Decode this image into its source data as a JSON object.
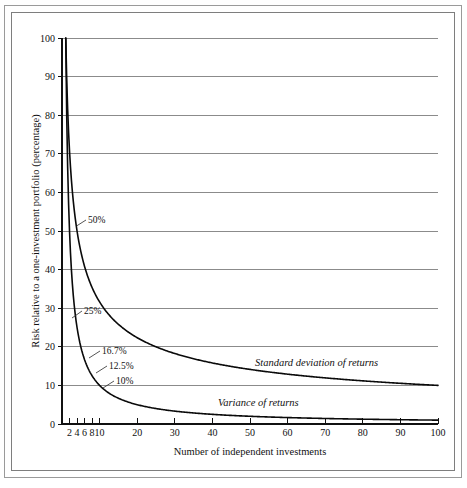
{
  "chart_data": {
    "type": "line",
    "title": "",
    "xlabel": "Number of independent investments",
    "ylabel": "Risk relative to a one-investment portfolio (percentage)",
    "xlim": [
      0,
      100
    ],
    "ylim": [
      0,
      100
    ],
    "grid": true,
    "legend_position": "inline-annotation",
    "x_ticks": [
      2,
      4,
      6,
      8,
      10,
      20,
      30,
      40,
      50,
      60,
      70,
      80,
      90,
      100
    ],
    "x_tick_labels": [
      "2",
      "4",
      "6",
      "8",
      "10",
      "20",
      "30",
      "40",
      "50",
      "60",
      "70",
      "80",
      "90",
      "100"
    ],
    "y_ticks": [
      0,
      10,
      20,
      30,
      40,
      50,
      60,
      70,
      80,
      90,
      100
    ],
    "y_tick_labels": [
      "0",
      "10",
      "20",
      "30",
      "40",
      "50",
      "60",
      "70",
      "80",
      "90",
      "100"
    ],
    "series": [
      {
        "name": "Standard deviation of returns",
        "formula": "100 / sqrt(n)",
        "x": [
          1,
          2,
          3,
          4,
          5,
          6,
          7,
          8,
          9,
          10,
          12,
          14,
          16,
          18,
          20,
          25,
          30,
          35,
          40,
          45,
          50,
          60,
          70,
          80,
          90,
          100
        ],
        "values": [
          100,
          70.7,
          57.7,
          50,
          44.7,
          40.8,
          37.8,
          35.4,
          33.3,
          31.6,
          28.9,
          26.7,
          25,
          23.6,
          22.4,
          20,
          18.3,
          16.9,
          15.8,
          14.9,
          14.1,
          12.9,
          12,
          11.2,
          10.5,
          10
        ]
      },
      {
        "name": "Variance of returns",
        "formula": "100 / n",
        "x": [
          1,
          2,
          3,
          4,
          5,
          6,
          7,
          8,
          9,
          10,
          12,
          14,
          16,
          18,
          20,
          25,
          30,
          35,
          40,
          45,
          50,
          60,
          70,
          80,
          90,
          100
        ],
        "values": [
          100,
          50,
          33.3,
          25,
          20,
          16.7,
          14.3,
          12.5,
          11.1,
          10,
          8.3,
          7.1,
          6.3,
          5.6,
          5,
          4,
          3.3,
          2.9,
          2.5,
          2.2,
          2,
          1.7,
          1.4,
          1.25,
          1.1,
          1
        ]
      }
    ],
    "annotations": [
      {
        "text": "50%",
        "x": 4,
        "y": 50,
        "series": "Standard deviation of returns"
      },
      {
        "text": "25%",
        "x": 4,
        "y": 25,
        "series": "Variance of returns"
      },
      {
        "text": "16.7%",
        "x": 6,
        "y": 16.7,
        "series": "Variance of returns"
      },
      {
        "text": "12.5%",
        "x": 8,
        "y": 12.5,
        "series": "Variance of returns"
      },
      {
        "text": "10%",
        "x": 10,
        "y": 10,
        "series": "Variance of returns"
      }
    ],
    "series_labels": [
      {
        "text": "Standard deviation of returns",
        "x": 58,
        "y": 15
      },
      {
        "text": "Variance of returns",
        "x": 52,
        "y": 6
      }
    ]
  },
  "colors": {
    "curve": "#0a0a0a",
    "gridline": "#6e6e6e",
    "axis": "#111111",
    "frame": "#9a9a9a",
    "background": "#ffffff"
  },
  "axis": {
    "y_title": "Risk relative to a one-investment portfolio (percentage)",
    "x_title": "Number of independent investments"
  },
  "ticks": {
    "y": [
      "100",
      "90",
      "80",
      "70",
      "60",
      "50",
      "40",
      "30",
      "20",
      "10",
      "0"
    ],
    "x": [
      "2",
      "4",
      "6",
      "8",
      "10",
      "20",
      "30",
      "40",
      "50",
      "60",
      "70",
      "80",
      "90",
      "100"
    ]
  },
  "labels": {
    "p50": "50%",
    "p25": "25%",
    "p167": "16.7%",
    "p125": "12.5%",
    "p10": "10%",
    "sd_curve": "Standard deviation of returns",
    "var_curve": "Variance of returns"
  }
}
